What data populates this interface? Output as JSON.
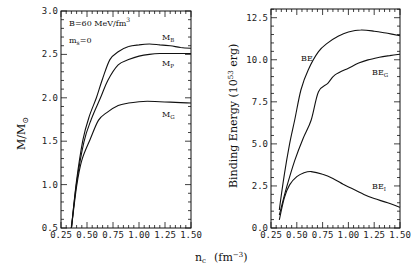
{
  "chart_data": [
    {
      "type": "line",
      "panel": "left",
      "title": "",
      "xlabel": "n_c (fm^-3)",
      "ylabel": "M/M_sun",
      "xlim": [
        0.25,
        1.5
      ],
      "ylim": [
        0.5,
        3.0
      ],
      "xticks": [
        "0.25",
        "0.50",
        "0.75",
        "1.00",
        "1.25",
        "1.50"
      ],
      "yticks": [
        "0.5",
        "1.0",
        "1.5",
        "2.0",
        "2.5",
        "3.0"
      ],
      "grid": false,
      "annotations": [
        "B=60 MeV/fm^3",
        "m_s=0"
      ],
      "series": [
        {
          "name": "M_B",
          "x": [
            0.35,
            0.4,
            0.46,
            0.52,
            0.59,
            0.65,
            0.72,
            0.8,
            0.9,
            1.0,
            1.1,
            1.2,
            1.3,
            1.4,
            1.5
          ],
          "y": [
            0.5,
            1.05,
            1.51,
            1.78,
            2.0,
            2.22,
            2.44,
            2.53,
            2.59,
            2.61,
            2.62,
            2.61,
            2.6,
            2.58,
            2.57
          ]
        },
        {
          "name": "M_P",
          "x": [
            0.35,
            0.4,
            0.47,
            0.54,
            0.63,
            0.7,
            0.8,
            0.9,
            1.0,
            1.1,
            1.2,
            1.3,
            1.4,
            1.5
          ],
          "y": [
            0.5,
            1.02,
            1.49,
            1.75,
            2.0,
            2.2,
            2.38,
            2.44,
            2.48,
            2.5,
            2.51,
            2.51,
            2.51,
            2.51
          ]
        },
        {
          "name": "M_G",
          "x": [
            0.35,
            0.4,
            0.45,
            0.53,
            0.61,
            0.69,
            0.8,
            0.9,
            1.0,
            1.08,
            1.2,
            1.3,
            1.4,
            1.5
          ],
          "y": [
            0.5,
            0.98,
            1.28,
            1.52,
            1.74,
            1.83,
            1.91,
            1.94,
            1.955,
            1.96,
            1.955,
            1.95,
            1.945,
            1.94
          ]
        }
      ]
    },
    {
      "type": "line",
      "panel": "right",
      "title": "",
      "xlabel": "n_c (fm^-3)",
      "ylabel": "Binding Energy (10^53 erg)",
      "xlim": [
        0.25,
        1.5
      ],
      "ylim": [
        0.0,
        13.0
      ],
      "xticks": [
        "0.25",
        "0.50",
        "0.75",
        "1.00",
        "1.25",
        "1.50"
      ],
      "yticks": [
        "0.0",
        "2.5",
        "5.0",
        "7.5",
        "10.0",
        "12.5"
      ],
      "grid": false,
      "series": [
        {
          "name": "BE",
          "x": [
            0.33,
            0.38,
            0.43,
            0.48,
            0.54,
            0.61,
            0.71,
            0.8,
            0.9,
            1.0,
            1.12,
            1.25,
            1.38,
            1.5
          ],
          "y": [
            1.07,
            3.2,
            5.0,
            6.42,
            8.2,
            9.39,
            10.48,
            11.0,
            11.4,
            11.65,
            11.77,
            11.7,
            11.57,
            11.43
          ]
        },
        {
          "name": "BE_G",
          "x": [
            0.33,
            0.4,
            0.48,
            0.56,
            0.64,
            0.71,
            0.8,
            0.87,
            1.0,
            1.1,
            1.19,
            1.3,
            1.4,
            1.5
          ],
          "y": [
            0.77,
            2.4,
            4.0,
            5.3,
            6.42,
            8.1,
            8.6,
            9.1,
            9.5,
            9.8,
            9.99,
            10.15,
            10.25,
            10.33
          ]
        },
        {
          "name": "BE_I",
          "x": [
            0.33,
            0.38,
            0.43,
            0.5,
            0.57,
            0.64,
            0.75,
            0.85,
            0.95,
            1.03,
            1.15,
            1.25,
            1.38,
            1.5
          ],
          "y": [
            0.48,
            1.8,
            2.56,
            3.05,
            3.28,
            3.35,
            3.2,
            2.95,
            2.6,
            2.36,
            2.0,
            1.75,
            1.5,
            1.23
          ]
        }
      ]
    }
  ],
  "labels": {
    "left_ylabel": "M/M",
    "left_ylabel_sub": "⊙",
    "right_ylabel": "Binding Energy (10",
    "right_ylabel_sup": "53",
    "right_ylabel_end": " erg)",
    "xlabel_main": "n",
    "xlabel_sub": "c",
    "xlabel_unit": "(fm",
    "xlabel_unit_sup": "−3",
    "xlabel_unit_end": ")",
    "annot_B": "B=60 MeV/fm",
    "annot_B_sup": "3",
    "annot_ms": "m",
    "annot_ms_sub": "s",
    "annot_ms_end": "=0",
    "series_labels": {
      "MB": "M",
      "MB_sub": "B",
      "MP": "M",
      "MP_sub": "P",
      "MG": "M",
      "MG_sub": "G",
      "BE": "BE",
      "BEG": "BE",
      "BEG_sub": "G",
      "BEI": "BE",
      "BEI_sub": "I"
    }
  }
}
